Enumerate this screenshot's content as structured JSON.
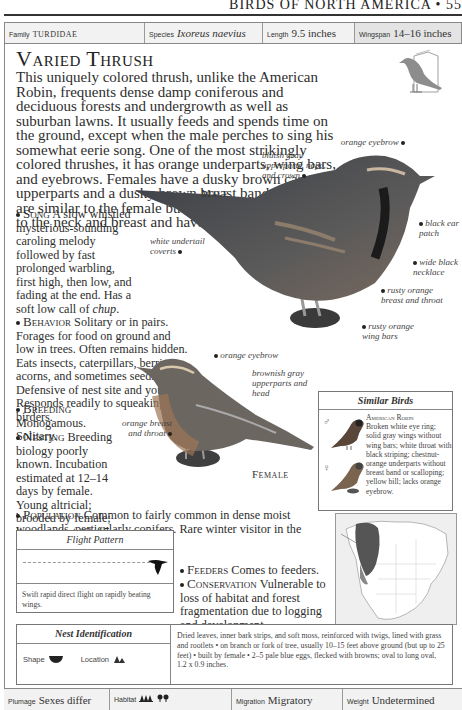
{
  "running_head": "BIRDS OF NORTH AMERICA • 557",
  "info_bar": {
    "family": {
      "label": "Family",
      "value": "TURDIDAE"
    },
    "species": {
      "label": "Species",
      "value": "Ixoreus naevius"
    },
    "length": {
      "label": "Length",
      "value": "9.5 inches"
    },
    "wingspan": {
      "label": "Wingspan",
      "value": "14–16 inches"
    }
  },
  "title": "Varied Thrush",
  "intro": "This uniquely colored thrush, unlike the American Robin, frequents dense damp coniferous and deciduous forests and undergrowth as well as suburban lawns. It usually feeds and spends time on the ground, except when the male perches to sing his somewhat eerie song. One of the most strikingly colored thrushes, it has orange underparts, wing bars, and eyebrows. Females have a dusky brown cast to the upperparts and a dusky brown breast band. Juveniles are similar to the female but have a scaly appearance to the neck and breast and have white underparts.",
  "sections": {
    "song": {
      "heading": "Song",
      "text": "A slow whistled mysterious-sounding caroling melody followed by fast prolonged warbling, first high, then low, and fading at the end. Has a soft low call of ",
      "call": "chup",
      "end": "."
    },
    "behavior": {
      "heading": "Behavior",
      "text": "Solitary or in pairs. Forages for food on ground and low in trees. Often remains hidden. Eats insects, caterpillars, berries, acorns, and sometimes seeds. Defensive of nest site and young. Responds readily to squeaking by birders."
    },
    "breeding": {
      "heading": "Breeding",
      "text": "Monogamous. Solitary."
    },
    "nesting": {
      "heading": "Nesting",
      "text": "Breeding biology poorly known. Incubation estimated at 12–14 days by female. Young altricial; brooded by female; leave nest at 13–15 days, fed by both sexes. 1–2 broods per year."
    },
    "population": {
      "heading": "Population",
      "text": "Common to fairly common in dense moist woodlands, particularly conifers. Rare winter visitor in the East to the Atlantic coast."
    },
    "feeders": {
      "heading": "Feeders",
      "text": "Comes to feeders."
    },
    "conservation": {
      "heading": "Conservation",
      "text": "Vulnerable to loss of habitat and forest fragmentation due to logging and development."
    }
  },
  "male": {
    "label": "Male",
    "callouts": {
      "eyebrow": "orange eyebrow",
      "upperparts": "bluish gray upperparts, nape, and crown",
      "ear_patch": "black ear patch",
      "necklace": "wide black necklace",
      "breast": "rusty orange breast and throat",
      "wing_bars": "rusty orange wing bars",
      "undertail": "white undertail coverts"
    }
  },
  "female": {
    "label": "Female",
    "callouts": {
      "eyebrow": "orange eyebrow",
      "upperparts": "brownish gray upperparts and head",
      "breast": "orange breast and throat"
    }
  },
  "similar_birds": {
    "heading": "Similar Birds",
    "male_symbol": "♂",
    "female_symbol": "♀",
    "name": "American Robin",
    "text": "Broken white eye ring; solid gray wings without wing bars; white throat with black striping; chestnut-orange underparts without breast band or scalloping; yellow bill; lacks orange eyebrow."
  },
  "flight_pattern": {
    "heading": "Flight Pattern",
    "text": "Swift rapid direct flight on rapidly beating wings."
  },
  "nest_identification": {
    "heading": "Nest Identification",
    "shape_label": "Shape",
    "location_label": "Location",
    "text": "Dried leaves, inner bark strips, and soft moss, reinforced with twigs, lined with grass and rootlets • on branch or fork of tree, usually 10–15 feet above ground (but up to 25 feet) • built by female • 2–5 pale blue eggs, flecked with browns; oval to long oval, 1.2 x 0.9 inches."
  },
  "footer": {
    "plumage": {
      "label": "Plumage",
      "value": "Sexes differ"
    },
    "habitat": {
      "label": "Habitat",
      "icons": [
        "coniferous-forest-icon",
        "deciduous-forest-icon"
      ]
    },
    "migration": {
      "label": "Migration",
      "value": "Migratory"
    },
    "weight": {
      "label": "Weight",
      "value": "Undetermined"
    }
  },
  "colors": {
    "map_range": "#555555",
    "map_bg": "#eeeeee",
    "bar_bg": "#f2f2f2",
    "bird_orange": "#b0703a"
  }
}
